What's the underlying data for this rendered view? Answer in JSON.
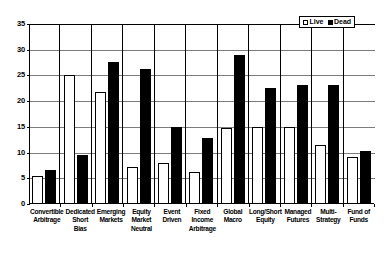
{
  "chart_data": {
    "type": "bar",
    "title": "",
    "xlabel": "",
    "ylabel": "",
    "ylim": [
      0,
      35
    ],
    "yticks": [
      0,
      5,
      10,
      15,
      20,
      25,
      30,
      35
    ],
    "grid": true,
    "legend_position": "top-right",
    "categories": [
      "Convertible Arbitrage",
      "Dedicated Short Bias",
      "Emerging Markets",
      "Equity Market Neutral",
      "Event Driven",
      "Fixed Income Arbitrage",
      "Global Macro",
      "Long/Short Equity",
      "Managed Futures",
      "Multi-Strategy",
      "Fund of Funds"
    ],
    "category_lines": [
      [
        "Convertible",
        "Arbitrage"
      ],
      [
        "Dedicated",
        "Short Bias"
      ],
      [
        "Emerging",
        "Markets"
      ],
      [
        "Equity",
        "Market",
        "Neutral"
      ],
      [
        "Event",
        "Driven"
      ],
      [
        "Fixed",
        "Income",
        "Arbitrage"
      ],
      [
        "Global",
        "Macro"
      ],
      [
        "Long/Short",
        "Equity"
      ],
      [
        "Managed",
        "Futures"
      ],
      [
        "Multi-",
        "Strategy"
      ],
      [
        "Fund of",
        "Funds"
      ]
    ],
    "series": [
      {
        "name": "Live",
        "color": "#ffffff",
        "values": [
          5.5,
          25.1,
          21.7,
          7.2,
          8.0,
          6.2,
          14.8,
          15.0,
          15.0,
          11.5,
          9.2
        ]
      },
      {
        "name": "Dead",
        "color": "#000000",
        "values": [
          6.6,
          9.5,
          27.7,
          26.3,
          15.0,
          12.9,
          29.0,
          22.6,
          23.1,
          23.2,
          10.3
        ]
      }
    ]
  },
  "legend": {
    "items": [
      {
        "label": "Live",
        "swatch": "hollow-square-swatch"
      },
      {
        "label": "Dead",
        "swatch": "filled-square-swatch"
      }
    ]
  }
}
